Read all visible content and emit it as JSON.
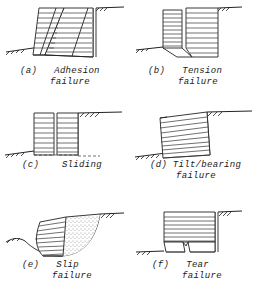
{
  "figure": {
    "title": "",
    "style": "hand-drawn engineering line diagram",
    "background_color": "#ffffff",
    "ink_color": "#222222",
    "panel_count": 6,
    "panels": [
      {
        "tag": "(a)",
        "label_line1": "Adhesion",
        "label_line2": "failure",
        "full_label": "Adhesion failure",
        "description": "Hatched wall block sheared along an inclined plane, leaning left off a vertical reference face"
      },
      {
        "tag": "(b)",
        "label_line1": "Tension",
        "label_line2": "failure",
        "full_label": "Tension failure",
        "description": "Narrow left hatched block separated from wider right hatched block by an angled basal gap"
      },
      {
        "tag": "(c)",
        "label_line1": "Sliding",
        "label_line2": "",
        "full_label": "Sliding",
        "description": "Two hatched blocks translated horizontally away from the vertical excavation face"
      },
      {
        "tag": "(d)",
        "label_line1": "Tilt/bearing",
        "label_line2": "failure",
        "full_label": "Tilt/bearing failure",
        "description": "Hatched block rotated clockwise, toe punched into the lower ground"
      },
      {
        "tag": "(e)",
        "label_line1": "Slip",
        "label_line2": "failure",
        "full_label": "Slip failure",
        "description": "Hatched block rotated on a curved circular slip surface with stippled soil wedge behind"
      },
      {
        "tag": "(f)",
        "label_line1": "Tear",
        "label_line2": "failure",
        "full_label": "Tear failure",
        "description": "Hatched block split by a V notch at its base forming two separated legs"
      }
    ]
  }
}
